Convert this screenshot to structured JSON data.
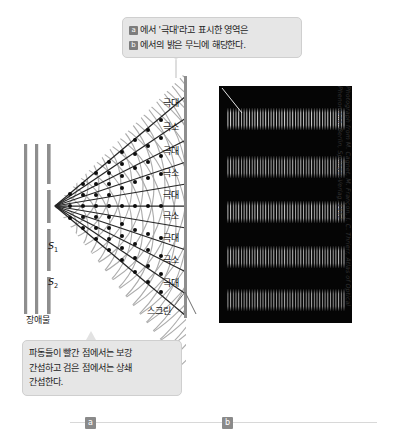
{
  "figure": {
    "callout_top": {
      "name": "callout-maxima-explanation",
      "line1_badge": "a",
      "line1_text": "에서 '극대'라고 표시한 영역은",
      "line2_badge": "b",
      "line2_text": "에서의 밝은 무늬에 해당한다."
    },
    "callout_bottom": {
      "name": "callout-interference-explanation",
      "line1": "파동들이 빨간 점에서는 보강",
      "line2": "간섭하고 검은 점에서는 상쇄",
      "line3": "간섭한다."
    },
    "diagram": {
      "slit_1_label": "S",
      "slit_1_sub": "1",
      "slit_2_label": "S",
      "slit_2_sub": "2",
      "barrier_label": "장애물",
      "screen_label": "스크린",
      "fringe_labels": [
        {
          "text": "극대",
          "y": 0
        },
        {
          "text": "극소",
          "y": 24
        },
        {
          "text": "극대",
          "y": 48
        },
        {
          "text": "극소",
          "y": 70
        },
        {
          "text": "극대",
          "y": 92
        },
        {
          "text": "극소",
          "y": 113
        },
        {
          "text": "극대",
          "y": 135
        },
        {
          "text": "극소",
          "y": 157
        },
        {
          "text": "극대",
          "y": 180
        }
      ]
    },
    "photo": {
      "name": "interference-pattern-photograph",
      "background_color": "#050505",
      "fringe_count": 5,
      "fringes_y": [
        22,
        70,
        115,
        160,
        203
      ]
    },
    "credit": {
      "line1": "Photograph from M. Cagnet, M. Françon, J. C. Thrierr, Atlas of Optical",
      "line2": "Phenomena, Berlin, Springer-Verlag, 1962"
    },
    "sections": [
      {
        "label": "a",
        "name": "section-marker-a"
      },
      {
        "label": "b",
        "name": "section-marker-b"
      }
    ],
    "colors": {
      "callout_bg": "#e6e6e6",
      "badge_bg": "#7d7d7d",
      "photo_bg": "#050505",
      "barrier": "#8a8a8a",
      "wave_line": "#9b9b9b",
      "ray_line": "#2a2a2a",
      "node_dot": "#101010"
    }
  }
}
